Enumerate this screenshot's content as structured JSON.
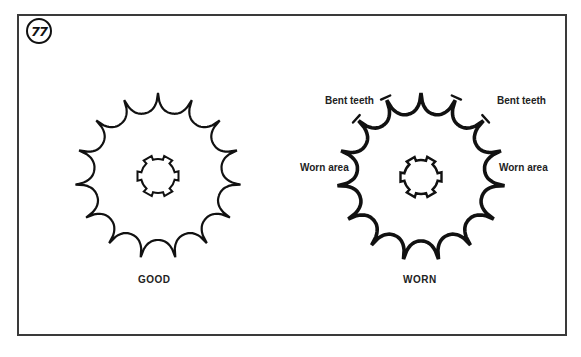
{
  "figure": {
    "number": "77",
    "border_color": "#3a3a3a"
  },
  "gears": [
    {
      "id": "good",
      "caption": "GOOD",
      "center": [
        158,
        176
      ],
      "teeth": 15,
      "tip_radius": 83,
      "root_radius": 64,
      "stroke_width": 2.2,
      "hub": {
        "radius": 17,
        "splines": 6,
        "spline_height": 4
      }
    },
    {
      "id": "worn",
      "caption": "WORN",
      "center": [
        421,
        177
      ],
      "teeth": 15,
      "tip_radius": 84,
      "root_radius": 64,
      "stroke_width": 3.6,
      "hub": {
        "radius": 17,
        "splines": 6,
        "spline_height": 4
      }
    }
  ],
  "callouts": {
    "bent_teeth_left": "Bent teeth",
    "bent_teeth_right": "Bent teeth",
    "worn_area_left": "Worn area",
    "worn_area_right": "Worn area"
  }
}
